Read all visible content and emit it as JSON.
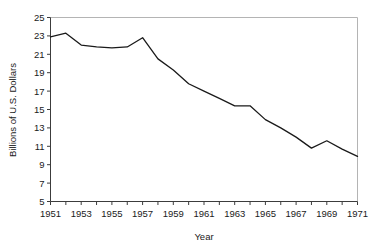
{
  "chart_data": {
    "type": "line",
    "title": "",
    "xlabel": "Year",
    "ylabel": "Billions of U.S. Dollars",
    "xlim": [
      1951,
      1971
    ],
    "ylim": [
      5,
      25
    ],
    "ytick_step": 2,
    "xtick_step": 1,
    "xlabel_step": 2,
    "grid": false,
    "legend": "none",
    "line_color": "#1a1a1a",
    "frame_color": "#b4b4b4",
    "axis_color": "#3c3c3c",
    "yticks": [
      5,
      7,
      9,
      11,
      13,
      15,
      17,
      19,
      21,
      23,
      25
    ],
    "ytick_labels": [
      "5",
      "7",
      "9",
      "11",
      "13",
      "15",
      "17",
      "19",
      "21",
      "23",
      "25"
    ],
    "xticks": [
      1951,
      1952,
      1953,
      1954,
      1955,
      1956,
      1957,
      1958,
      1959,
      1960,
      1961,
      1962,
      1963,
      1964,
      1965,
      1966,
      1967,
      1968,
      1969,
      1970,
      1971
    ],
    "xtick_labels": [
      "1951",
      "",
      "1953",
      "",
      "1955",
      "",
      "1957",
      "",
      "1959",
      "",
      "1961",
      "",
      "1963",
      "",
      "1965",
      "",
      "1967",
      "",
      "1969",
      "",
      "1971"
    ],
    "x": [
      1951,
      1952,
      1953,
      1954,
      1955,
      1956,
      1957,
      1958,
      1959,
      1960,
      1961,
      1962,
      1963,
      1964,
      1965,
      1966,
      1967,
      1968,
      1969,
      1970,
      1971
    ],
    "values": [
      22.9,
      23.3,
      22.0,
      21.8,
      21.7,
      21.8,
      22.8,
      20.5,
      19.3,
      17.8,
      17.0,
      16.2,
      15.4,
      15.4,
      13.9,
      13.0,
      12.0,
      10.8,
      11.6,
      10.7,
      9.9
    ],
    "series": [
      {
        "name": "Billions of U.S. Dollars",
        "values": [
          22.9,
          23.3,
          22.0,
          21.8,
          21.7,
          21.8,
          22.8,
          20.5,
          19.3,
          17.8,
          17.0,
          16.2,
          15.4,
          15.4,
          13.9,
          13.0,
          12.0,
          10.8,
          11.6,
          10.7,
          9.9
        ]
      }
    ]
  }
}
